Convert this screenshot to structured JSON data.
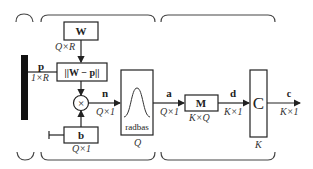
{
  "diagram": {
    "type": "rbf-network-block-diagram",
    "input": {
      "name": "p",
      "dims": "1×R"
    },
    "weight": {
      "name": "W",
      "dims": "Q×R"
    },
    "distance": {
      "label": "||W − p||"
    },
    "bias": {
      "name": "b",
      "dims": "Q×1"
    },
    "net_input": {
      "name": "n",
      "dims": "Q×1"
    },
    "transfer": {
      "label": "radbas",
      "size": "Q"
    },
    "hidden_output": {
      "name": "a",
      "dims": "Q×1"
    },
    "second_weight": {
      "name": "M",
      "dims": "K×Q"
    },
    "second_output": {
      "name": "d",
      "dims": "K×1"
    },
    "competitive": {
      "label": "C",
      "size": "K"
    },
    "output": {
      "name": "c",
      "dims": "K×1"
    },
    "multiply_symbol": "×"
  },
  "colors": {
    "line": "#222222",
    "brace": "#444444",
    "input_bar": "#111111"
  }
}
